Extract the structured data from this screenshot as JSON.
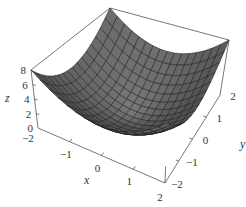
{
  "chart_data": {
    "type": "surface3d",
    "title": "",
    "function": "z = x^2 + y^2",
    "xlabel": "x",
    "ylabel": "y",
    "zlabel": "z",
    "xlim": [
      -2,
      2
    ],
    "ylim": [
      -2,
      2
    ],
    "zlim": [
      0,
      8
    ],
    "x_ticks": [
      "-2",
      "-1",
      "0",
      "1",
      "2"
    ],
    "y_ticks": [
      "-2",
      "-1",
      "0",
      "1",
      "2"
    ],
    "z_ticks": [
      "0",
      "2",
      "4",
      "6",
      "8"
    ],
    "x_tick_values": [
      -2,
      -1,
      0,
      1,
      2
    ],
    "y_tick_values": [
      -2,
      -1,
      0,
      1,
      2
    ],
    "z_tick_values": [
      0,
      2,
      4,
      6,
      8
    ],
    "mesh_divisions": 16,
    "grid": false,
    "box": true,
    "legend": null,
    "colors": {
      "surface": "#6b6b6b",
      "surface_dark": "#4a4a4a",
      "mesh": "#1e1e1e",
      "box": "#555555",
      "text": "#333333"
    }
  }
}
